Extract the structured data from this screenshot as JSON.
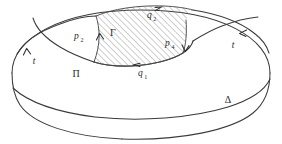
{
  "figure": {
    "background_color": "#ffffff",
    "ink_color": "#3a3a3a",
    "hatch_color": "#8d8d8d"
  },
  "labels": {
    "region_gamma": "Γ",
    "region_pi": "Π",
    "region_delta": "Δ",
    "path_p2_base": "p",
    "path_p2_sub": "2",
    "path_p4_base": "p",
    "path_p4_sub": "4",
    "path_q1_base": "q",
    "path_q1_sub": "1",
    "path_q2_base": "q",
    "path_q2_sub": "2",
    "path_t_left": "t",
    "path_t_right": "t"
  },
  "label_positions": {
    "region_gamma": {
      "x": 113,
      "y": 36
    },
    "region_pi": {
      "x": 76,
      "y": 77
    },
    "region_delta": {
      "x": 228,
      "y": 103
    },
    "path_p2": {
      "x": 79,
      "y": 39
    },
    "path_p4": {
      "x": 170,
      "y": 46
    },
    "path_q1": {
      "x": 143,
      "y": 76
    },
    "path_q2": {
      "x": 152,
      "y": 18
    },
    "path_t_left": {
      "x": 34,
      "y": 64
    },
    "path_t_right": {
      "x": 233,
      "y": 48
    }
  },
  "arrows": [
    {
      "name": "arrow-q2-top",
      "direction": "right",
      "x": 160,
      "y": 9
    },
    {
      "name": "arrow-q1-bottom",
      "direction": "left",
      "x": 135,
      "y": 64
    },
    {
      "name": "arrow-p2-left",
      "direction": "up",
      "x": 100,
      "y": 35
    },
    {
      "name": "arrow-p4-right",
      "direction": "down",
      "x": 184,
      "y": 48
    },
    {
      "name": "arrow-t-left",
      "direction": "up",
      "x": 27,
      "y": 50
    },
    {
      "name": "arrow-t-right",
      "direction": "upleft",
      "x": 243,
      "y": 33
    }
  ]
}
